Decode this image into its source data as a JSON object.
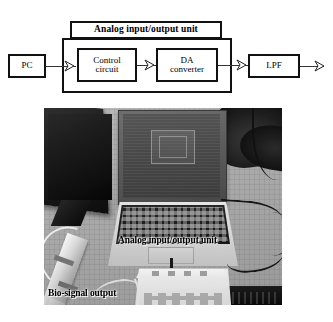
{
  "figure": {
    "diagram": {
      "blocks": [
        {
          "id": "pc",
          "label": "PC"
        },
        {
          "id": "control",
          "line1": "Control",
          "line2": "circuit"
        },
        {
          "id": "da",
          "line1": "DA",
          "line2": "converter"
        },
        {
          "id": "lpf",
          "label": "LPF"
        }
      ],
      "group_title": "Analog input/output unit",
      "flow": "PC → Control circuit → DA converter → LPF → output",
      "arrow_glyph": "›"
    },
    "photo": {
      "labels": [
        {
          "id": "analog-unit",
          "text": "Analog input/output unit"
        },
        {
          "id": "bio-signal-output",
          "text": "Bio-signal output"
        }
      ]
    }
  },
  "colors": {
    "stroke": "#111111",
    "wire": "#333333",
    "background": "#ffffff",
    "photo_base": "#a3a29d"
  }
}
